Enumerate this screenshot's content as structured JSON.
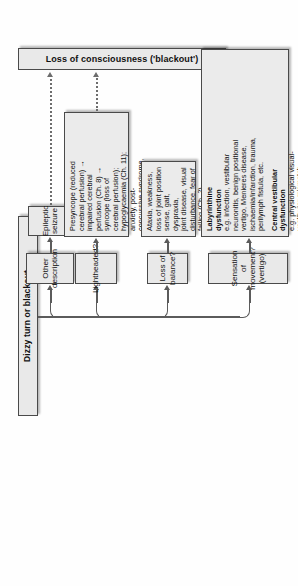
{
  "diagram": {
    "title": "Dizzy turn or blackout",
    "root": {
      "label": "Dizzy turn or blackout"
    },
    "branches": [
      {
        "id": "vertigo",
        "question": "Sensation of movement?\n(vertigo)",
        "detail_heading_1": "Labyrinthine\ndysfunction",
        "detail_body_1": "e.g. infection, vestibular\nneuronitis, benign positional\nvertigo, Menieres disease,\nischaemia/infarction, trauma,\nperilymph fistula, etc.",
        "detail_heading_2": "Central vestibular\ndysfunction",
        "detail_body_2": "e.g. physiological visual-\nvestibular mismatch,\ndemyelination, migraine,\nposterior fossa mass lesion,\nvertebro-basilar ischaemia, etc."
      },
      {
        "id": "balance",
        "question": "Loss of balance?",
        "detail_body_1": "Ataxia, weakness,\nloss of joint position\nsense, gait, dyspraxia,\njoint disease, visual\ndisturbance, fear of\nfalling (Ch. 2)"
      },
      {
        "id": "lightheaded",
        "question": "Lightheaded?",
        "detail_body_1": "Presyncope (reduced\ncerebral perfusion) →\nimpaired cerebral\nperfusion (Ch. 8)   →\nsyncope (loss of\ncerebral perfusion);\nhypoglycaemia (Ch. 11);\nanxiety, post-\nconcussive syndrome,\npanic attack, non-\nepileptic attack"
      },
      {
        "id": "other",
        "question": "Other\ndescription",
        "terminal": "Epileptic\nseizure"
      }
    ],
    "outcome": {
      "label": "Loss of consciousness ('blackout')"
    },
    "colors": {
      "box_fill": "#e9e9e9",
      "box_border": "#4a4a4a",
      "connector": "#5b5b5b",
      "page_background": "#ffffff"
    }
  }
}
